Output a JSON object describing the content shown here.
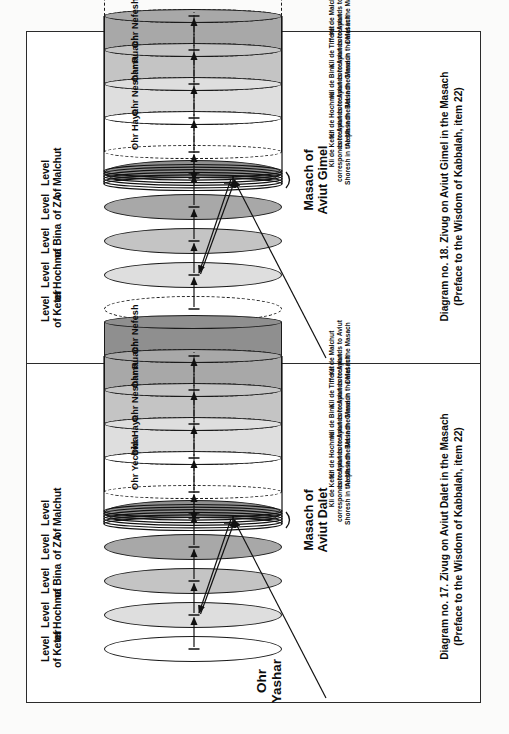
{
  "document": {
    "title": "Zivug on Aviut — Masach diagrams",
    "background_color": "#ffffff",
    "border_color": "#2b2b2b"
  },
  "palette": {
    "keter": "#ffffff",
    "hochma": "#dedede",
    "bina": "#c4c4c4",
    "za": "#a8a8a8",
    "malchut": "#8f8f8f",
    "ink": "#0d0d0d",
    "line": "#1a1a1a"
  },
  "diagrams": [
    {
      "id": "diagram-18",
      "caption_line1": "Diagram no. 18. Zivug on Aviut Gimel in the Masach",
      "caption_line2": "(Preface to the Wisdom of Kabbalah, item 22)",
      "ohr_yashar_line1": "Ohr",
      "ohr_yashar_line2": "Yashar",
      "masach_line1": "Masach of",
      "masach_line2": "Aviut Gimel",
      "levels": [
        {
          "line1": "Level",
          "line2": "of Keter",
          "fill": "#ffffff",
          "style": "dashed"
        },
        {
          "line1": "Level",
          "line2": "of Hochma",
          "fill": "#dedede",
          "style": "solid"
        },
        {
          "line1": "Level",
          "line2": "of Bina",
          "fill": "#c4c4c4",
          "style": "solid"
        },
        {
          "line1": "Level",
          "line2": "of ZA",
          "fill": "#a8a8a8",
          "style": "solid"
        },
        {
          "line1": "Level",
          "line2": "of Malchut",
          "fill": "#8f8f8f",
          "style": "solid"
        }
      ],
      "segments": [
        {
          "ohr": "",
          "kli1": "Kli de Keter",
          "kli2": "corresponds to Aviut",
          "kli3": "Shoresh in the Masach",
          "fill": "#ffffff",
          "style": "masach"
        },
        {
          "ohr": "Ohr Haya",
          "kli1": "Kli de Hochma",
          "kli2": "corresponds to Aviut",
          "kli3": "Aleph in the Masach",
          "fill": "#ffffff",
          "style": "solid"
        },
        {
          "ohr": "Ohr Neshama",
          "kli1": "Kli de Bina",
          "kli2": "corresponds to Aviut",
          "kli3": "Bet in the Masach",
          "fill": "#dedede",
          "style": "solid"
        },
        {
          "ohr": "Ohr Ruach",
          "kli1": "Kli de Tifferet",
          "kli2": "corresponds to Aviut",
          "kli3": "Gimel in the Masach",
          "fill": "#c4c4c4",
          "style": "solid"
        },
        {
          "ohr": "Ohr Nefesh",
          "kli1": "Kli de Malchut",
          "kli2": "corresponds to Aviut",
          "kli3": "Dalet in the Masach",
          "fill": "#a8a8a8",
          "style": "solid"
        },
        {
          "ohr": "",
          "kli1": "",
          "kli2": "",
          "kli3": "",
          "fill": "#ffffff",
          "style": "dashed"
        }
      ]
    },
    {
      "id": "diagram-17",
      "caption_line1": "Diagram no. 17. Zivug on Aviut Dalet in the Masach",
      "caption_line2": "(Preface to the Wisdom of Kabbalah, item 22)",
      "ohr_yashar_line1": "Ohr",
      "ohr_yashar_line2": "Yashar",
      "masach_line1": "Masach of",
      "masach_line2": "Aviut Dalet",
      "levels": [
        {
          "line1": "Level",
          "line2": "of Keter",
          "fill": "#ffffff",
          "style": "solid"
        },
        {
          "line1": "Level",
          "line2": "of Hochma",
          "fill": "#dedede",
          "style": "solid"
        },
        {
          "line1": "Level",
          "line2": "of Bina",
          "fill": "#c4c4c4",
          "style": "solid"
        },
        {
          "line1": "Level",
          "line2": "of ZA",
          "fill": "#a8a8a8",
          "style": "solid"
        },
        {
          "line1": "Level",
          "line2": "of Malchut",
          "fill": "#8f8f8f",
          "style": "solid"
        }
      ],
      "segments": [
        {
          "ohr": "",
          "kli1": "Kli de Keter",
          "kli2": "corresponds to Aviut",
          "kli3": "Shoresh in the Masach",
          "fill": "#ffffff",
          "style": "masach"
        },
        {
          "ohr": "Ohr Yechida",
          "kli1": "Kli de Hochma",
          "kli2": "corresponds to Aviut",
          "kli3": "Aleph in the Masach",
          "fill": "#ffffff",
          "style": "solid"
        },
        {
          "ohr": "Ohr Haya",
          "kli1": "Kli de Bina",
          "kli2": "corresponds to Aviut",
          "kli3": "Bet in the Masach",
          "fill": "#dedede",
          "style": "solid"
        },
        {
          "ohr": "Ohr Neshama",
          "kli1": "Kli de Tifferet",
          "kli2": "corresponds to Aviut",
          "kli3": "Gimel in the Masach",
          "fill": "#c4c4c4",
          "style": "solid"
        },
        {
          "ohr": "Ohr Ruach",
          "kli1": "Kli de Malchut",
          "kli2": "corresponds to Aviut",
          "kli3": "Dalet in the Masach",
          "fill": "#a8a8a8",
          "style": "solid"
        },
        {
          "ohr": "Ohr Nefesh",
          "kli1": "",
          "kli2": "",
          "kli3": "",
          "fill": "#8f8f8f",
          "style": "solid"
        }
      ]
    }
  ]
}
